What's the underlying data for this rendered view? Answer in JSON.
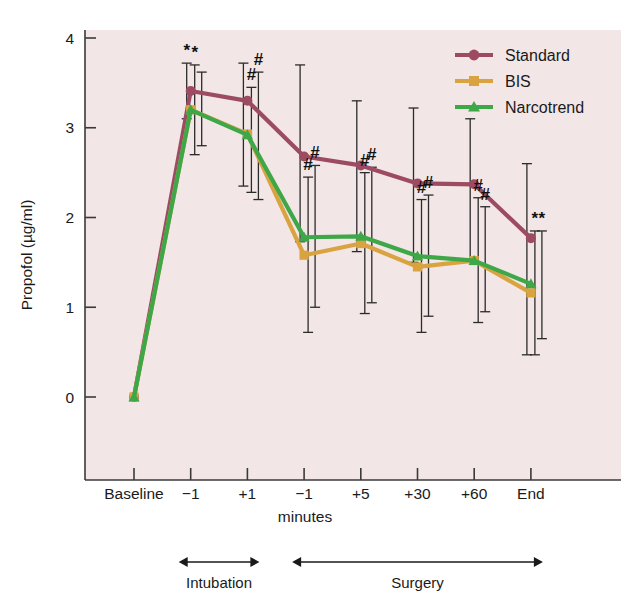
{
  "chart_data": {
    "type": "line",
    "title": "",
    "xlabel": "minutes",
    "ylabel": "Propofol (µg/ml)",
    "categories": [
      "Baseline",
      "−1",
      "+1",
      "−1",
      "+5",
      "+30",
      "+60",
      "End"
    ],
    "xlim": [
      0,
      7
    ],
    "ylim": [
      0,
      4
    ],
    "yticks": [
      0,
      1,
      2,
      3,
      4
    ],
    "ytick_labels": [
      "0",
      "1",
      "2",
      "3",
      "4"
    ],
    "grid": false,
    "legend_position": "top-right",
    "plot_background": "#f2e6e6",
    "series": [
      {
        "name": "Standard",
        "color": "#9c4b63",
        "marker": "circle",
        "values": [
          0.0,
          3.41,
          3.3,
          2.68,
          2.58,
          2.38,
          2.37,
          1.77
        ],
        "err_low": [
          0.0,
          3.1,
          2.35,
          1.73,
          1.62,
          1.5,
          1.52,
          0.47
        ],
        "err_high": [
          0.0,
          3.72,
          3.72,
          3.7,
          3.3,
          3.22,
          3.1,
          2.6
        ]
      },
      {
        "name": "BIS",
        "color": "#d9a340",
        "marker": "square",
        "values": [
          0.0,
          3.2,
          2.93,
          1.58,
          1.71,
          1.45,
          1.52,
          1.16
        ],
        "err_low": [
          0.0,
          2.7,
          2.28,
          0.72,
          0.93,
          0.72,
          0.83,
          0.47
        ],
        "err_high": [
          0.0,
          3.7,
          3.45,
          2.45,
          2.5,
          2.2,
          2.22,
          1.85
        ]
      },
      {
        "name": "Narcotrend",
        "color": "#3ea747",
        "marker": "triangle",
        "values": [
          0.0,
          3.2,
          2.92,
          1.78,
          1.79,
          1.57,
          1.52,
          1.26
        ],
        "err_low": [
          0.0,
          2.8,
          2.2,
          1.0,
          1.05,
          0.9,
          0.95,
          0.65
        ],
        "err_high": [
          0.0,
          3.62,
          3.62,
          2.58,
          2.56,
          2.25,
          2.12,
          1.85
        ]
      }
    ],
    "annotations": [
      {
        "text": "*",
        "x_index": 1,
        "series": "Standard",
        "value": 3.41
      },
      {
        "text": "*",
        "x_index": 1,
        "series": "BIS",
        "value": 3.2
      },
      {
        "text": "#",
        "x_index": 2,
        "series": "BIS",
        "value": 2.93
      },
      {
        "text": "#",
        "x_index": 2,
        "series": "Narcotrend",
        "value": 2.92
      },
      {
        "text": "#",
        "x_index": 3,
        "series": "BIS",
        "value": 1.58
      },
      {
        "text": "#",
        "x_index": 3,
        "series": "Narcotrend",
        "value": 1.78
      },
      {
        "text": "#",
        "x_index": 4,
        "series": "BIS",
        "value": 1.71
      },
      {
        "text": "#",
        "x_index": 4,
        "series": "Narcotrend",
        "value": 1.79
      },
      {
        "text": "#",
        "x_index": 5,
        "series": "BIS",
        "value": 1.45
      },
      {
        "text": "#",
        "x_index": 5,
        "series": "Narcotrend",
        "value": 1.57
      },
      {
        "text": "#",
        "x_index": 6,
        "series": "BIS",
        "value": 1.52
      },
      {
        "text": "#",
        "x_index": 6,
        "series": "Narcotrend",
        "value": 1.52
      },
      {
        "text": "*",
        "x_index": 7,
        "series": "BIS",
        "value": 1.16
      },
      {
        "text": "*",
        "x_index": 7,
        "series": "Narcotrend",
        "value": 1.26
      }
    ],
    "phase_brackets": [
      {
        "label": "Intubation",
        "from_index": 1,
        "to_index": 2
      },
      {
        "label": "Surgery",
        "from_index": 3,
        "to_index": 7
      }
    ]
  },
  "legend": {
    "items": [
      {
        "label": "Standard"
      },
      {
        "label": "BIS"
      },
      {
        "label": "Narcotrend"
      }
    ]
  },
  "axis": {
    "y_title": "Propofol (µg/ml)",
    "x_title": "minutes"
  }
}
